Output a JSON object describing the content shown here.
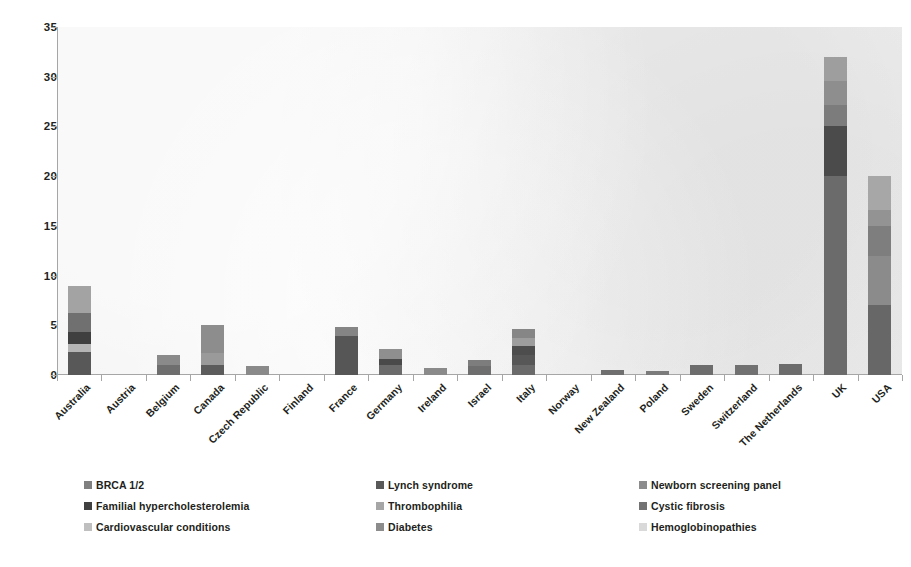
{
  "chart_data": {
    "type": "bar",
    "subtype": "stacked-bar",
    "title": "",
    "xlabel": "",
    "ylabel": "",
    "ylim": [
      0,
      35
    ],
    "y_ticks": [
      0,
      5,
      10,
      15,
      20,
      25,
      30,
      35
    ],
    "grid": false,
    "legend_position": "bottom",
    "plot_background": "#f2f2f2",
    "categories": [
      "Australia",
      "Austria",
      "Belgium",
      "Canada",
      "Czech Republic",
      "Finland",
      "France",
      "Germany",
      "Ireland",
      "Israel",
      "Italy",
      "Norway",
      "New Zealand",
      "Poland",
      "Sweden",
      "Switzerland",
      "The Netherlands",
      "UK",
      "USA"
    ],
    "series": [
      {
        "name": "BRCA 1/2",
        "color": "#808080",
        "values": [
          2.3,
          0,
          1.1,
          1.0,
          0.9,
          0,
          0,
          1.0,
          0.7,
          0.9,
          1.0,
          0,
          0.5,
          0.4,
          1.0,
          1.0,
          1.1,
          20.0,
          7.0
        ]
      },
      {
        "name": "Lynch syndrome",
        "color": "#595959",
        "values": [
          0,
          0,
          0,
          0,
          0,
          0,
          3.9,
          0,
          0,
          0,
          1.0,
          0,
          0,
          0,
          0,
          0,
          0,
          0,
          0
        ]
      },
      {
        "name": "Newborn screening panel",
        "color": "#7f7f7f",
        "values": [
          0,
          0,
          0,
          0,
          0,
          0,
          0,
          0,
          0,
          0,
          0,
          0,
          0,
          0,
          0,
          0,
          0,
          0,
          0
        ]
      },
      {
        "name": "Familial hypercholesterolemia",
        "color": "#404040",
        "values": [
          1.0,
          0,
          0,
          0,
          0,
          0,
          0,
          0.6,
          0,
          0.6,
          0.9,
          0,
          0,
          0,
          0,
          0,
          0,
          4.8,
          0
        ]
      },
      {
        "name": "Thrombophilia",
        "color": "#a6a6a6",
        "values": [
          0.7,
          0,
          0,
          1.2,
          0,
          0,
          0,
          1.0,
          0,
          0,
          0,
          0,
          0,
          0,
          0,
          0,
          0,
          0,
          3.0
        ]
      },
      {
        "name": "Cystic fibrosis",
        "color": "#737373",
        "values": [
          2.0,
          0,
          0.9,
          0,
          0,
          0,
          0,
          0,
          0,
          0,
          0.8,
          0,
          0,
          0,
          0,
          0,
          0,
          2.2,
          3.0
        ]
      },
      {
        "name": "Cardiovascular conditions",
        "color": "#bfbfbf",
        "values": [
          0,
          0,
          0,
          0,
          0,
          0,
          0,
          0,
          0,
          0,
          0,
          0,
          0,
          0,
          0,
          0,
          0,
          0,
          2.0
        ]
      },
      {
        "name": "Diabetes",
        "color": "#8c8c8c",
        "values": [
          0,
          0,
          0,
          0,
          0,
          0,
          0.9,
          0,
          0,
          0,
          0,
          0,
          0,
          0,
          0,
          0,
          0,
          2.5,
          2.0
        ]
      },
      {
        "name": "Hemoglobinopathies",
        "color": "#d9d9d9",
        "values": [
          3.0,
          0,
          0,
          2.8,
          0,
          0,
          0,
          0,
          0,
          0,
          0.9,
          0,
          0,
          0,
          0,
          0,
          0,
          2.5,
          3.0
        ]
      }
    ],
    "totals": [
      9.0,
      0,
      2.0,
      5.0,
      0.9,
      0,
      4.8,
      2.6,
      0.7,
      1.5,
      4.6,
      0,
      0.5,
      0.4,
      1.0,
      1.0,
      1.1,
      32.0,
      20.0
    ],
    "bar_segments": [
      {
        "category": "Australia",
        "segments": [
          {
            "series": "BRCA 1/2",
            "from": 0,
            "to": 2.3,
            "color": "#585858"
          },
          {
            "series": "Thrombophilia",
            "from": 2.3,
            "to": 3.1,
            "color": "#b5b5b5"
          },
          {
            "series": "Familial hypercholesterolemia",
            "from": 3.1,
            "to": 4.3,
            "color": "#3f3f3f"
          },
          {
            "series": "Cystic fibrosis",
            "from": 4.3,
            "to": 6.2,
            "color": "#707070"
          },
          {
            "series": "Hemoglobinopathies",
            "from": 6.2,
            "to": 9.0,
            "color": "#a3a3a3"
          }
        ]
      },
      {
        "category": "Austria",
        "segments": []
      },
      {
        "category": "Belgium",
        "segments": [
          {
            "series": "BRCA 1/2",
            "from": 0,
            "to": 1.0,
            "color": "#6e6e6e"
          },
          {
            "series": "Cystic fibrosis",
            "from": 1.0,
            "to": 2.0,
            "color": "#8a8a8a"
          }
        ]
      },
      {
        "category": "Canada",
        "segments": [
          {
            "series": "BRCA 1/2",
            "from": 0,
            "to": 1.0,
            "color": "#5c5c5c"
          },
          {
            "series": "Thrombophilia",
            "from": 1.0,
            "to": 2.2,
            "color": "#9a9a9a"
          },
          {
            "series": "Hemoglobinopathies",
            "from": 2.2,
            "to": 5.0,
            "color": "#8d8d8d"
          }
        ]
      },
      {
        "category": "Czech Republic",
        "segments": [
          {
            "series": "BRCA 1/2",
            "from": 0,
            "to": 0.9,
            "color": "#8a8a8a"
          }
        ]
      },
      {
        "category": "Finland",
        "segments": []
      },
      {
        "category": "France",
        "segments": [
          {
            "series": "Lynch syndrome",
            "from": 0,
            "to": 3.9,
            "color": "#565656"
          },
          {
            "series": "Diabetes",
            "from": 3.9,
            "to": 4.8,
            "color": "#858585"
          }
        ]
      },
      {
        "category": "Germany",
        "segments": [
          {
            "series": "BRCA 1/2",
            "from": 0,
            "to": 1.0,
            "color": "#6b6b6b"
          },
          {
            "series": "Familial hypercholesterolemia",
            "from": 1.0,
            "to": 1.6,
            "color": "#4a4a4a"
          },
          {
            "series": "Thrombophilia",
            "from": 1.6,
            "to": 2.6,
            "color": "#8f8f8f"
          }
        ]
      },
      {
        "category": "Ireland",
        "segments": [
          {
            "series": "BRCA 1/2",
            "from": 0,
            "to": 0.7,
            "color": "#8a8a8a"
          }
        ]
      },
      {
        "category": "Israel",
        "segments": [
          {
            "series": "BRCA 1/2",
            "from": 0,
            "to": 0.9,
            "color": "#6e6e6e"
          },
          {
            "series": "Familial hypercholesterolemia",
            "from": 0.9,
            "to": 1.5,
            "color": "#7d7d7d"
          }
        ]
      },
      {
        "category": "Italy",
        "segments": [
          {
            "series": "BRCA 1/2",
            "from": 0,
            "to": 1.0,
            "color": "#6a6a6a"
          },
          {
            "series": "Lynch syndrome",
            "from": 1.0,
            "to": 2.0,
            "color": "#575757"
          },
          {
            "series": "Familial hypercholesterolemia",
            "from": 2.0,
            "to": 2.9,
            "color": "#4d4d4d"
          },
          {
            "series": "Cystic fibrosis",
            "from": 2.9,
            "to": 3.7,
            "color": "#9d9d9d"
          },
          {
            "series": "Hemoglobinopathies",
            "from": 3.7,
            "to": 4.6,
            "color": "#868686"
          }
        ]
      },
      {
        "category": "Norway",
        "segments": []
      },
      {
        "category": "New Zealand",
        "segments": [
          {
            "series": "BRCA 1/2",
            "from": 0,
            "to": 0.5,
            "color": "#6f6f6f"
          }
        ]
      },
      {
        "category": "Poland",
        "segments": [
          {
            "series": "BRCA 1/2",
            "from": 0,
            "to": 0.4,
            "color": "#7b7b7b"
          }
        ]
      },
      {
        "category": "Sweden",
        "segments": [
          {
            "series": "BRCA 1/2",
            "from": 0,
            "to": 1.0,
            "color": "#6d6d6d"
          }
        ]
      },
      {
        "category": "Switzerland",
        "segments": [
          {
            "series": "BRCA 1/2",
            "from": 0,
            "to": 1.0,
            "color": "#717171"
          }
        ]
      },
      {
        "category": "The Netherlands",
        "segments": [
          {
            "series": "BRCA 1/2",
            "from": 0,
            "to": 1.1,
            "color": "#6c6c6c"
          }
        ]
      },
      {
        "category": "UK",
        "segments": [
          {
            "series": "BRCA 1/2",
            "from": 0,
            "to": 20.0,
            "color": "#6b6b6b"
          },
          {
            "series": "Familial hypercholesterolemia",
            "from": 20.0,
            "to": 25.0,
            "color": "#4b4b4b"
          },
          {
            "series": "Cystic fibrosis",
            "from": 25.0,
            "to": 27.2,
            "color": "#7c7c7c"
          },
          {
            "series": "Diabetes",
            "from": 27.2,
            "to": 29.6,
            "color": "#8e8e8e"
          },
          {
            "series": "Hemoglobinopathies",
            "from": 29.6,
            "to": 32.0,
            "color": "#9e9e9e"
          }
        ]
      },
      {
        "category": "USA",
        "segments": [
          {
            "series": "BRCA 1/2",
            "from": 0,
            "to": 7.0,
            "color": "#676767"
          },
          {
            "series": "Cystic fibrosis",
            "from": 7.0,
            "to": 12.0,
            "color": "#8b8b8b"
          },
          {
            "series": "Cardiovascular conditions",
            "from": 12.0,
            "to": 15.0,
            "color": "#7e7e7e"
          },
          {
            "series": "Diabetes",
            "from": 15.0,
            "to": 16.6,
            "color": "#939393"
          },
          {
            "series": "Hemoglobinopathies",
            "from": 16.6,
            "to": 20.0,
            "color": "#a7a7a7"
          }
        ]
      }
    ]
  },
  "legend": {
    "entries": [
      {
        "label": "BRCA 1/2",
        "color": "#808080",
        "col": 0,
        "row": 0
      },
      {
        "label": "Lynch syndrome",
        "color": "#595959",
        "col": 1,
        "row": 0
      },
      {
        "label": "Newborn screening panel",
        "color": "#8c8c8c",
        "col": 2,
        "row": 0
      },
      {
        "label": "Familial hypercholesterolemia",
        "color": "#404040",
        "col": 0,
        "row": 1
      },
      {
        "label": "Thrombophilia",
        "color": "#a6a6a6",
        "col": 1,
        "row": 1
      },
      {
        "label": "Cystic fibrosis",
        "color": "#737373",
        "col": 2,
        "row": 1
      },
      {
        "label": "Cardiovascular conditions",
        "color": "#bfbfbf",
        "col": 0,
        "row": 2
      },
      {
        "label": "Diabetes",
        "color": "#8c8c8c",
        "col": 1,
        "row": 2
      },
      {
        "label": "Hemoglobinopathies",
        "color": "#d9d9d9",
        "col": 2,
        "row": 2
      }
    ]
  }
}
